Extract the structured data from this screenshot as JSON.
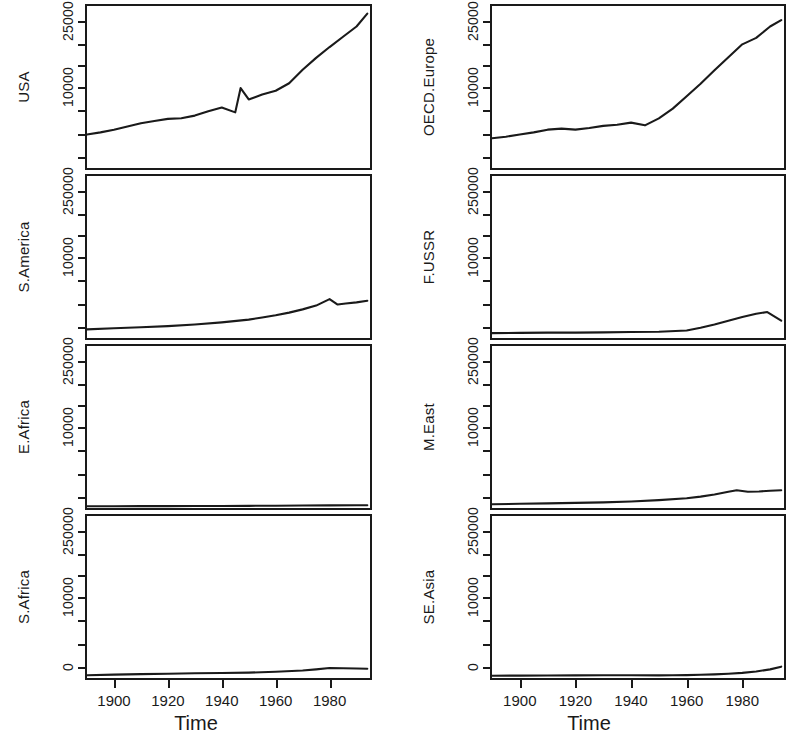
{
  "figure": {
    "type": "multi-panel-time-series",
    "rows": 4,
    "cols": 2,
    "xlabel": "Time",
    "background": "#ffffff",
    "line_color": "#1a1a1a"
  },
  "axis": {
    "x_title": "Time",
    "x_ticks": [
      "1900",
      "1920",
      "1940",
      "1960",
      "1980"
    ],
    "x_tick_values": [
      1900,
      1920,
      1940,
      1960,
      1980
    ],
    "x_range": [
      1890,
      1995
    ],
    "y_ticks_top": [
      "25000",
      "10000"
    ],
    "y_ticks_other": [
      "250000",
      "10000"
    ],
    "y_tick_zero": "0"
  },
  "chart_data": {
    "type": "line",
    "title": "",
    "xlabel": "Time",
    "ylabel": "",
    "grid": false,
    "legend": "none",
    "shared_x": {
      "range": [
        1890,
        1995
      ],
      "ticks": [
        1900,
        1920,
        1940,
        1960,
        1980
      ]
    },
    "panels": [
      {
        "name": "USA",
        "position": {
          "row": 1,
          "col": 1
        },
        "ylabel": "USA",
        "ytick_labels": [
          "25000",
          "10000"
        ],
        "ytick_values": [
          25000,
          10000
        ],
        "ylim": [
          0,
          30000
        ],
        "x": [
          1890,
          1895,
          1900,
          1905,
          1910,
          1915,
          1920,
          1925,
          1930,
          1935,
          1940,
          1945,
          1947,
          1950,
          1955,
          1960,
          1965,
          1970,
          1975,
          1980,
          1985,
          1990,
          1994
        ],
        "y": [
          6200,
          6600,
          7100,
          7700,
          8300,
          8700,
          9100,
          9200,
          9700,
          10500,
          11200,
          10300,
          14800,
          12700,
          13600,
          14300,
          15700,
          18200,
          20400,
          22400,
          24300,
          26200,
          28600
        ]
      },
      {
        "name": "OECD.Europe",
        "position": {
          "row": 1,
          "col": 2
        },
        "ylabel": "OECD.Europe",
        "ytick_labels": [
          "25000",
          "10000"
        ],
        "ytick_values": [
          25000,
          10000
        ],
        "ylim": [
          0,
          30000
        ],
        "x": [
          1890,
          1895,
          1900,
          1905,
          1910,
          1915,
          1920,
          1925,
          1930,
          1935,
          1940,
          1945,
          1950,
          1955,
          1960,
          1965,
          1970,
          1975,
          1980,
          1985,
          1990,
          1994
        ],
        "y": [
          5500,
          5800,
          6200,
          6600,
          7100,
          7300,
          7100,
          7400,
          7800,
          8000,
          8400,
          7900,
          9200,
          11000,
          13300,
          15600,
          18100,
          20500,
          22900,
          24100,
          26200,
          27400
        ]
      },
      {
        "name": "S.America",
        "position": {
          "row": 2,
          "col": 1
        },
        "ylabel": "S.America",
        "ytick_labels": [
          "250000",
          "10000"
        ],
        "ytick_values": [
          250000,
          10000
        ],
        "ylim": [
          0,
          30000
        ],
        "x": [
          1890,
          1900,
          1910,
          1920,
          1930,
          1940,
          1950,
          1955,
          1960,
          1965,
          1970,
          1975,
          1980,
          1983,
          1986,
          1990,
          1994
        ],
        "y": [
          1600,
          1800,
          2000,
          2200,
          2500,
          2900,
          3400,
          3800,
          4200,
          4700,
          5300,
          6000,
          7200,
          6200,
          6400,
          6600,
          6900
        ]
      },
      {
        "name": "F.USSR",
        "position": {
          "row": 2,
          "col": 2
        },
        "ylabel": "F.USSR",
        "ytick_labels": [
          "250000",
          "10000"
        ],
        "ytick_values": [
          250000,
          10000
        ],
        "ylim": [
          0,
          30000
        ],
        "x": [
          1890,
          1900,
          1910,
          1920,
          1930,
          1940,
          1950,
          1960,
          1965,
          1970,
          1975,
          1980,
          1985,
          1989,
          1994
        ],
        "y": [
          900,
          950,
          1000,
          1000,
          1050,
          1100,
          1150,
          1400,
          1900,
          2500,
          3200,
          3900,
          4500,
          4800,
          3200
        ]
      },
      {
        "name": "E.Africa",
        "position": {
          "row": 3,
          "col": 1
        },
        "ylabel": "E.Africa",
        "ytick_labels": [
          "250000",
          "10000"
        ],
        "ytick_values": [
          250000,
          10000
        ],
        "ylim": [
          0,
          30000
        ],
        "x": [
          1890,
          1900,
          1910,
          1920,
          1930,
          1940,
          1950,
          1960,
          1970,
          1980,
          1990,
          1994
        ],
        "y": [
          320,
          330,
          340,
          350,
          365,
          380,
          400,
          420,
          450,
          480,
          500,
          510
        ]
      },
      {
        "name": "M.East",
        "position": {
          "row": 3,
          "col": 2
        },
        "ylabel": "M.East",
        "ytick_labels": [
          "250000",
          "10000"
        ],
        "ytick_values": [
          250000,
          10000
        ],
        "ylim": [
          0,
          30000
        ],
        "x": [
          1890,
          1900,
          1910,
          1920,
          1930,
          1940,
          1950,
          1960,
          1965,
          1970,
          1975,
          1978,
          1982,
          1986,
          1990,
          1994
        ],
        "y": [
          700,
          780,
          860,
          950,
          1050,
          1200,
          1450,
          1800,
          2100,
          2500,
          3000,
          3300,
          3000,
          3050,
          3200,
          3300
        ]
      },
      {
        "name": "S.Africa",
        "position": {
          "row": 4,
          "col": 1
        },
        "ylabel": "S.Africa",
        "ytick_labels": [
          "250000",
          "10000"
        ],
        "ytick_values": [
          250000,
          10000
        ],
        "ylim": [
          0,
          30000
        ],
        "x": [
          1890,
          1900,
          1910,
          1920,
          1930,
          1940,
          1950,
          1960,
          1970,
          1975,
          1980,
          1985,
          1990,
          1994
        ],
        "y": [
          500,
          620,
          720,
          800,
          870,
          930,
          1000,
          1150,
          1400,
          1600,
          1850,
          1800,
          1750,
          1720
        ]
      },
      {
        "name": "SE.Asia",
        "position": {
          "row": 4,
          "col": 2
        },
        "ylabel": "SE.Asia",
        "ytick_labels": [
          "250000",
          "10000"
        ],
        "ytick_values": [
          250000,
          10000
        ],
        "ylim": [
          0,
          30000
        ],
        "x": [
          1890,
          1900,
          1910,
          1920,
          1930,
          1940,
          1950,
          1955,
          1960,
          1965,
          1970,
          1975,
          1980,
          1985,
          1990,
          1994
        ],
        "y": [
          420,
          440,
          460,
          480,
          500,
          520,
          480,
          500,
          540,
          600,
          680,
          800,
          950,
          1200,
          1600,
          2100
        ]
      }
    ]
  }
}
